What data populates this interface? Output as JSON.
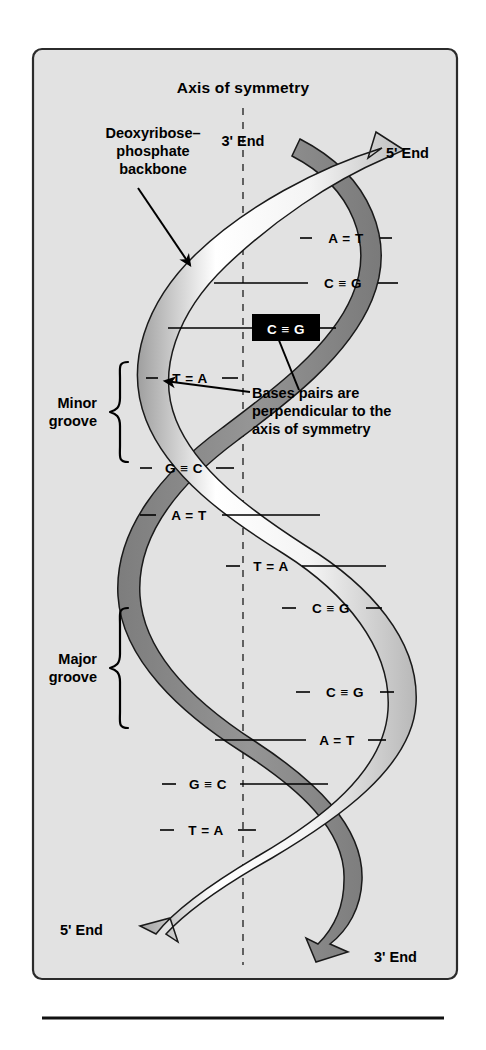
{
  "figure": {
    "title": "Axis of symmetry",
    "panel_bg": "#e2e2e2",
    "page_bg": "#ffffff",
    "ribbon_front_light": "#ffffff",
    "ribbon_front_mid": "#d2d2d2",
    "ribbon_back_dark": "#8c8c8c",
    "outline_color": "#1a1a1a",
    "axis_color": "#4a4a4a"
  },
  "annotations": {
    "backbone": {
      "line1": "Deoxyribose–",
      "line2": "phosphate",
      "line3": "backbone"
    },
    "base_pair_note": {
      "line1": "Bases pairs are",
      "line2": "perpendicular to the",
      "line3": "axis of symmetry"
    }
  },
  "grooves": [
    {
      "name": "minor-groove",
      "line1": "Minor",
      "line2": "groove"
    },
    {
      "name": "major-groove",
      "line1": "Major",
      "line2": "groove"
    }
  ],
  "ends": {
    "top_left": "3' End",
    "top_right": "5' End",
    "bottom_left": "5' End",
    "bottom_right": "3' End"
  },
  "base_pairs": [
    {
      "index": 1,
      "label": "A = T",
      "left": "A",
      "bond": "=",
      "right": "T",
      "highlighted": false
    },
    {
      "index": 2,
      "label": "C ≡ G",
      "left": "C",
      "bond": "≡",
      "right": "G",
      "highlighted": false
    },
    {
      "index": 3,
      "label": "C ≡ G",
      "left": "C",
      "bond": "≡",
      "right": "G",
      "highlighted": true
    },
    {
      "index": 4,
      "label": "T = A",
      "left": "T",
      "bond": "=",
      "right": "A",
      "highlighted": false
    },
    {
      "index": 5,
      "label": "G ≡ C",
      "left": "G",
      "bond": "≡",
      "right": "C",
      "highlighted": false
    },
    {
      "index": 6,
      "label": "A = T",
      "left": "A",
      "bond": "=",
      "right": "T",
      "highlighted": false
    },
    {
      "index": 7,
      "label": "T = A",
      "left": "T",
      "bond": "=",
      "right": "A",
      "highlighted": false
    },
    {
      "index": 8,
      "label": "C ≡ G",
      "left": "C",
      "bond": "≡",
      "right": "G",
      "highlighted": false
    },
    {
      "index": 9,
      "label": "C ≡ G",
      "left": "C",
      "bond": "≡",
      "right": "G",
      "highlighted": false
    },
    {
      "index": 10,
      "label": "A = T",
      "left": "A",
      "bond": "=",
      "right": "T",
      "highlighted": false
    },
    {
      "index": 11,
      "label": "G ≡ C",
      "left": "G",
      "bond": "≡",
      "right": "C",
      "highlighted": false
    },
    {
      "index": 12,
      "label": "T = A",
      "left": "T",
      "bond": "=",
      "right": "A",
      "highlighted": false
    }
  ]
}
